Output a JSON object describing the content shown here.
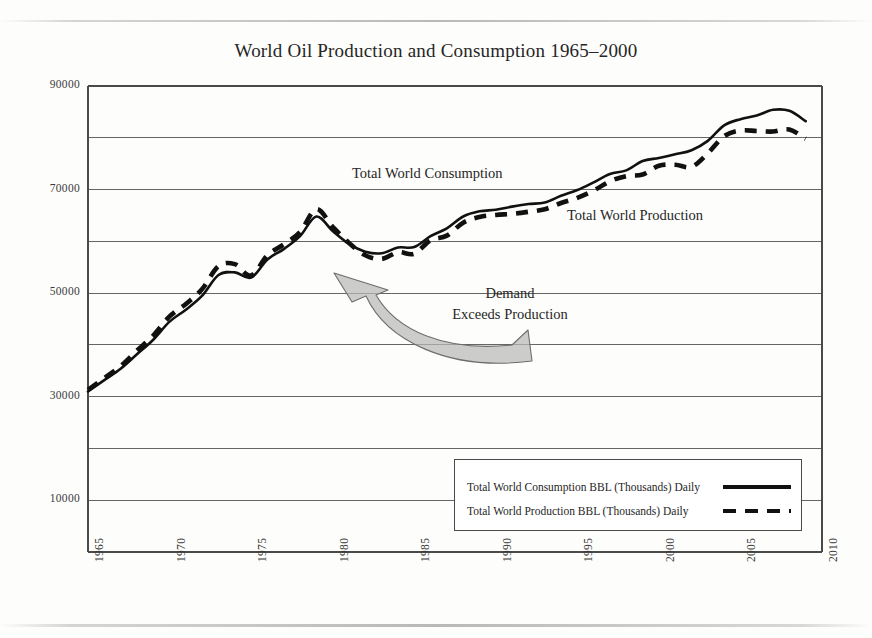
{
  "figure": {
    "title": "World Oil Production and Consumption 1965–2000"
  },
  "annotations": {
    "consumption_label": "Total World Consumption",
    "production_label": "Total World Production",
    "callout_line1": "Demand",
    "callout_line2": "Exceeds Production"
  },
  "legend": {
    "consumption": "Total World Consumption BBL (Thousands) Daily",
    "production": "Total World Production BBL (Thousands) Daily"
  },
  "axis": {
    "y_ticks": [
      "90000",
      "70000",
      "50000",
      "30000",
      "10000"
    ],
    "x_ticks": [
      "1965",
      "1970",
      "1975",
      "1980",
      "1985",
      "1990",
      "1995",
      "2000",
      "2005",
      "2010"
    ]
  },
  "colors": {
    "line": "#111111",
    "grid": "#666666",
    "frame": "#4a4a4a",
    "arrow_fill": "#b9b9b9",
    "arrow_stroke": "#6d6d6d",
    "text": "#262626",
    "background": "#fdfdfc"
  },
  "chart_data": {
    "type": "line",
    "title": "World Oil Production and Consumption 1965–2000",
    "xlabel": "",
    "ylabel": "BBL (Thousands) Daily",
    "xlim": [
      1965,
      2010
    ],
    "ylim": [
      0,
      90000
    ],
    "y_tick_values": [
      10000,
      30000,
      50000,
      70000,
      90000
    ],
    "y_gridline_step": 10000,
    "x_tick_values": [
      1965,
      1970,
      1975,
      1980,
      1985,
      1990,
      1995,
      2000,
      2005,
      2010
    ],
    "grid": true,
    "legend_position": "inside bottom-right",
    "x": [
      1965,
      1966,
      1967,
      1968,
      1969,
      1970,
      1971,
      1972,
      1973,
      1974,
      1975,
      1976,
      1977,
      1978,
      1979,
      1980,
      1981,
      1982,
      1983,
      1984,
      1985,
      1986,
      1987,
      1988,
      1989,
      1990,
      1991,
      1992,
      1993,
      1994,
      1995,
      1996,
      1997,
      1998,
      1999,
      2000,
      2001,
      2002,
      2003,
      2004,
      2005,
      2006,
      2007,
      2008,
      2009
    ],
    "series": [
      {
        "name": "Total World Consumption BBL (Thousands) Daily",
        "style": "solid",
        "values": [
          31000,
          33200,
          35400,
          38200,
          41000,
          44500,
          46800,
          49500,
          53500,
          54000,
          53000,
          56500,
          58500,
          61000,
          64800,
          62000,
          59500,
          58000,
          57700,
          58800,
          58900,
          61000,
          62500,
          64800,
          65800,
          66100,
          66700,
          67200,
          67500,
          68800,
          69900,
          71400,
          73000,
          73700,
          75500,
          76100,
          76800,
          77600,
          79400,
          82400,
          83600,
          84300,
          85400,
          85200,
          83200
        ]
      },
      {
        "name": "Total World Production BBL (Thousands) Daily",
        "style": "dashed",
        "values": [
          31300,
          33600,
          35900,
          38900,
          41800,
          45500,
          47900,
          50800,
          55200,
          55600,
          53400,
          57300,
          59400,
          61800,
          66200,
          62800,
          59700,
          57300,
          56600,
          57900,
          57600,
          60200,
          61100,
          63600,
          64700,
          65100,
          65300,
          65700,
          66200,
          67400,
          68400,
          69800,
          71600,
          72600,
          72900,
          74600,
          74800,
          74400,
          77000,
          80300,
          81400,
          81300,
          81200,
          81600,
          79800
        ]
      }
    ],
    "annotations": [
      {
        "text": "Total World Consumption",
        "x": 1987,
        "y": 73000
      },
      {
        "text": "Total World Production",
        "x": 1995,
        "y": 64500
      },
      {
        "text": "Demand Exceeds Production",
        "x": 1997,
        "y": 51000,
        "arrow_to_x": 1982,
        "arrow_to_y": 53000
      }
    ]
  }
}
